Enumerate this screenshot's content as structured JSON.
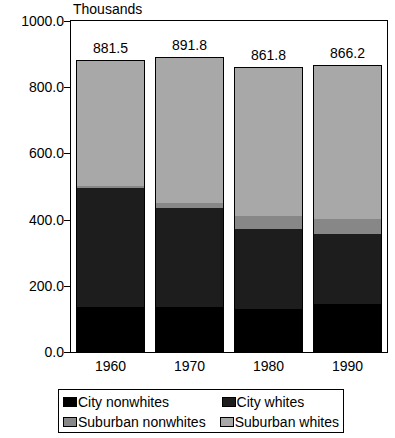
{
  "chart_data": {
    "type": "bar",
    "subtype": "stacked-column",
    "title": "",
    "xlabel": "",
    "ylabel": "Thousands",
    "ylim": [
      0,
      1000
    ],
    "ytick_labels": [
      "0.0",
      "200.0",
      "400.0",
      "600.0",
      "800.0",
      "1000.0"
    ],
    "ytick_values": [
      0,
      200,
      400,
      600,
      800,
      1000
    ],
    "grid": false,
    "legend_position": "bottom",
    "categories": [
      "1960",
      "1970",
      "1980",
      "1990"
    ],
    "series": [
      {
        "name": "City nonwhites",
        "color": "#000000",
        "values": [
          135,
          135,
          130,
          145
        ]
      },
      {
        "name": "City whites",
        "color": "#1d1d1d",
        "values": [
          362,
          299,
          243,
          213
        ]
      },
      {
        "name": "Suburban nonwhites",
        "color": "#878787",
        "values": [
          6,
          16,
          39,
          45
        ]
      },
      {
        "name": "Suburban whites",
        "color": "#a8a8a8",
        "values": [
          378.5,
          441.8,
          449.8,
          463.2
        ]
      }
    ],
    "totals": [
      881.5,
      891.8,
      861.8,
      866.2
    ],
    "total_labels": [
      "881.5",
      "891.8",
      "861.8",
      "866.2"
    ]
  },
  "axes": {
    "y_title": "Thousands"
  },
  "legend": {
    "entries": [
      {
        "label": "City nonwhites",
        "swatch": "swatch-city-nonwhites"
      },
      {
        "label": "City whites",
        "swatch": "swatch-city-whites"
      },
      {
        "label": "Suburban nonwhites",
        "swatch": "swatch-sub-nonwhites"
      },
      {
        "label": "Suburban whites",
        "swatch": "swatch-sub-whites"
      }
    ]
  }
}
